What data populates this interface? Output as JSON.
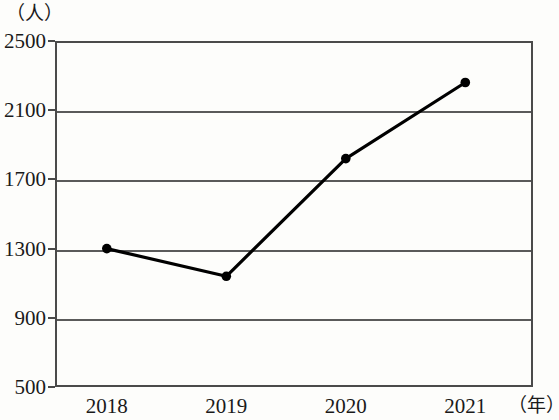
{
  "chart_data": {
    "type": "line",
    "title": "",
    "xlabel": "（年）",
    "ylabel": "（人）",
    "categories": [
      "2018",
      "2019",
      "2020",
      "2021"
    ],
    "values": [
      1300,
      1140,
      1820,
      2260
    ],
    "series": [
      {
        "name": "人数",
        "values": [
          1300,
          1140,
          1820,
          2260
        ]
      }
    ],
    "ylim": [
      500,
      2500
    ],
    "y_ticks": [
      2500,
      2100,
      1700,
      1300,
      900,
      500
    ],
    "y_tick_labels": [
      "2500",
      "2100",
      "1700",
      "1300",
      "900",
      "500"
    ],
    "x_ticks": [
      "2018",
      "2019",
      "2020",
      "2021"
    ],
    "grid": true,
    "legend": false,
    "line_color": "#000000",
    "marker": "circle",
    "marker_color": "#000000",
    "axis_color": "#4a4a4a",
    "background": "#fdfdfb"
  },
  "axis": {
    "y_unit": "（人）",
    "x_unit": "（年）"
  }
}
